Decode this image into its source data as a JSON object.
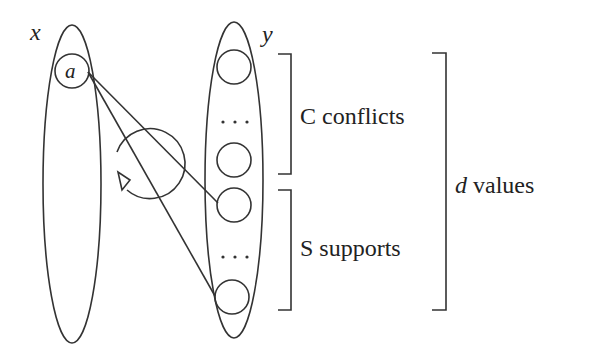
{
  "diagram": {
    "variables": [
      {
        "id": "x",
        "label": "x"
      },
      {
        "id": "y",
        "label": "y"
      }
    ],
    "x_values": [
      {
        "label": "a"
      }
    ],
    "y_values": {
      "ellipsis_label": "...",
      "groups": [
        {
          "id": "conflicts",
          "prefix": "C",
          "label": "conflicts",
          "visible_circles": 2
        },
        {
          "id": "supports",
          "prefix": "S",
          "label": "supports",
          "visible_circles": 2
        }
      ]
    },
    "outer_bracket": {
      "symbol": "d",
      "label": "values"
    },
    "edges": [
      {
        "from": "a",
        "to": "first-support-value"
      },
      {
        "from": "a",
        "to": "last-support-value"
      }
    ],
    "loop_arrow": {
      "direction": "counterclockwise"
    },
    "colors": {
      "stroke": "#333333",
      "text": "#222222",
      "background": "#ffffff"
    }
  }
}
